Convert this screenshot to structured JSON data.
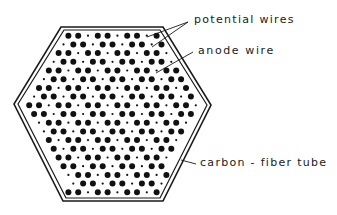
{
  "diagram": {
    "labels": {
      "potential_wires": "potential  wires",
      "anode_wire": "anode  wire",
      "carbon_fiber_tube": "carbon - fiber  tube"
    },
    "tube": {
      "shape": "hexagon",
      "outer_vertices": [
        [
          61,
          27
        ],
        [
          163,
          27
        ],
        [
          211,
          105
        ],
        [
          163,
          201
        ],
        [
          63,
          201
        ],
        [
          14,
          104
        ]
      ],
      "inner_vertices": [
        [
          64,
          30
        ],
        [
          160,
          30
        ],
        [
          207,
          105
        ],
        [
          160,
          198
        ],
        [
          66,
          198
        ],
        [
          18,
          104
        ]
      ],
      "stroke_color": "#1a1a1a"
    },
    "wire_pattern": {
      "row_spacing": 8.7,
      "col_spacing": 9.8,
      "anode_every": 3,
      "potential_wire_radius": 3.0,
      "anode_wire_radius": 1.1,
      "color": "#111111"
    },
    "leaders": [
      {
        "name": "potential-leader-1",
        "from": [
          188,
          22
        ],
        "to": [
          147,
          37
        ]
      },
      {
        "name": "potential-leader-2",
        "from": [
          188,
          22
        ],
        "to": [
          152,
          47
        ]
      },
      {
        "name": "anode-leader",
        "from": [
          193,
          52
        ],
        "to": [
          156,
          73
        ]
      },
      {
        "name": "carbon-leader",
        "from": [
          196,
          164
        ],
        "to": [
          181,
          160
        ]
      }
    ]
  }
}
